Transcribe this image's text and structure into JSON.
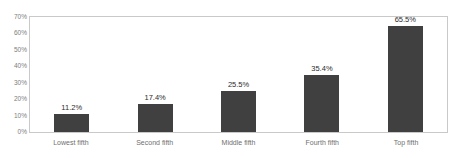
{
  "chart_data": {
    "type": "bar",
    "title": "1979-2005",
    "categories": [
      "Lowest fifth",
      "Second fifth",
      "Middle fifth",
      "Fourth fifth",
      "Top fifth"
    ],
    "values": [
      11.2,
      17.4,
      25.5,
      35.4,
      65.5
    ],
    "data_labels": [
      "11.2%",
      "17.4%",
      "25.5%",
      "35.4%",
      "65.5%"
    ],
    "xlabel": "",
    "ylabel": "",
    "ylim": [
      0,
      70
    ],
    "y_ticks": [
      70,
      60,
      50,
      40,
      30,
      20,
      10,
      0
    ],
    "y_tick_labels": [
      "70%",
      "60%",
      "50%",
      "40%",
      "30%",
      "20%",
      "10%",
      "0%"
    ],
    "grid": false,
    "legend": "none",
    "series": [
      {
        "name": "Percent change",
        "values": [
          11.2,
          17.4,
          25.5,
          35.4,
          65.5
        ]
      }
    ],
    "colors": {
      "bar": "#404040",
      "plot_border": "#c9c9c9",
      "background": "#ffffff",
      "tick_text": "#7d7d7d",
      "category_text": "#6f6f6f",
      "value_text": "#2b2b2b"
    }
  }
}
